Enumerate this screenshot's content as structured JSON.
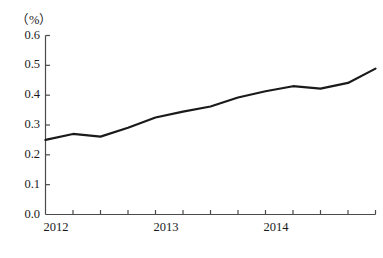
{
  "chart_data": {
    "type": "line",
    "title": "",
    "subtitle": "",
    "xlabel": "",
    "ylabel": "",
    "unit_label": "（%）",
    "ylim": [
      0.0,
      0.6
    ],
    "ytick_labels": [
      "0.6",
      "0.5",
      "0.4",
      "0.3",
      "0.2",
      "0.1",
      "0.0"
    ],
    "ytick_values": [
      0.6,
      0.5,
      0.4,
      0.3,
      0.2,
      0.1,
      0.0
    ],
    "xtick_labels": [
      "2012",
      "2013",
      "2014"
    ],
    "xtick_positions": [
      0,
      4,
      8
    ],
    "x_tick_count": 13,
    "grid": false,
    "legend": "none",
    "line_color": "#1a1a1a",
    "axis_color": "#4a4a4a",
    "x": [
      0,
      1,
      2,
      3,
      4,
      5,
      6,
      7,
      8,
      9,
      10,
      11,
      12
    ],
    "values": [
      0.25,
      0.27,
      0.261,
      0.291,
      0.325,
      0.345,
      0.362,
      0.392,
      0.413,
      0.43,
      0.422,
      0.441,
      0.489
    ],
    "series": [
      {
        "name": "",
        "values": [
          0.25,
          0.27,
          0.261,
          0.291,
          0.325,
          0.345,
          0.362,
          0.392,
          0.413,
          0.43,
          0.422,
          0.441,
          0.489
        ]
      }
    ]
  }
}
